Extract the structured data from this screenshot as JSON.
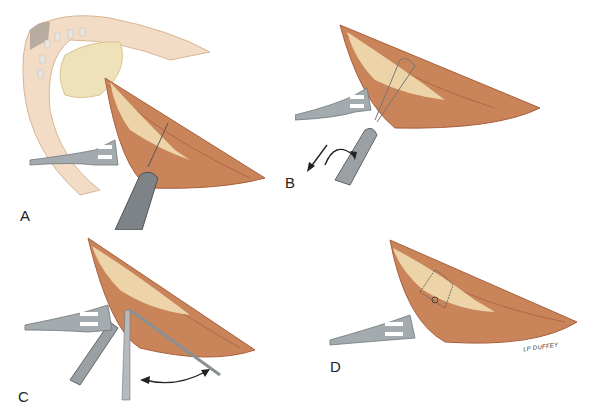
{
  "figure": {
    "type": "surgical illustration",
    "panels": [
      {
        "id": "A",
        "label": "A",
        "description": "Ear with incision exposing tendon; retractor and drill passing through tendon"
      },
      {
        "id": "B",
        "label": "B",
        "description": "Suture loop passed through tendon; instrument pulled with rotation (arrows)"
      },
      {
        "id": "C",
        "label": "C",
        "description": "Suture tied with instruments; double-headed arrow indicating tension"
      },
      {
        "id": "D",
        "label": "D",
        "description": "Completed suture knot on tendon with retractor"
      }
    ],
    "signature": "LP DUFFEY"
  },
  "colors": {
    "muscle": "#c9845a",
    "muscle_dark": "#a9603c",
    "tendon": "#ecd3a8",
    "skin": "#f3dcc5",
    "skin_edge": "#d9b597",
    "metal": "#9aa0a3",
    "metal_dark": "#5f6568",
    "cartilage": "#f0e2b8"
  }
}
